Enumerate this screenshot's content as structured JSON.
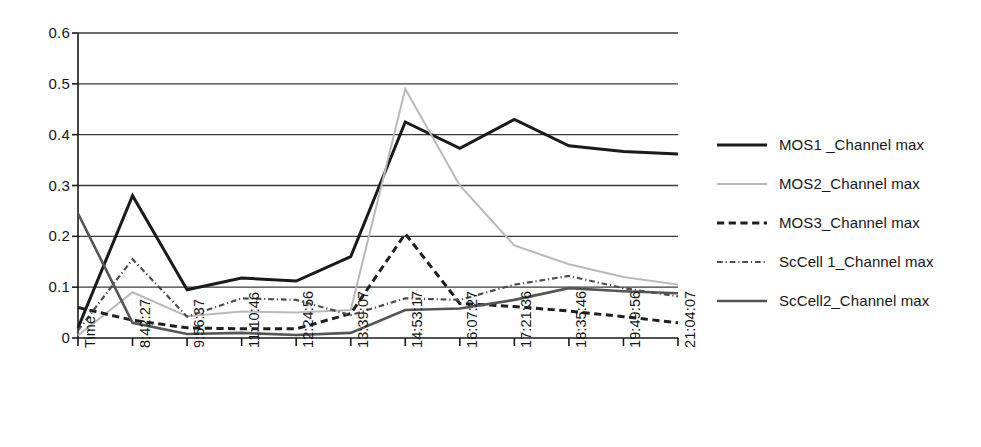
{
  "chart_data": {
    "type": "line",
    "title": "",
    "subtitle": "",
    "xlabel": "",
    "ylabel": "",
    "ylim": [
      0,
      0.6
    ],
    "ytick_labels": [
      "0.6",
      "0.5",
      "0.4",
      "0.3",
      "0.2",
      "0.1",
      "0"
    ],
    "ytick_values": [
      0.6,
      0.5,
      0.4,
      0.3,
      0.2,
      0.1,
      0
    ],
    "grid": "horizontal",
    "legend_position": "right",
    "categories": [
      "Time",
      "8:42:27",
      "9:56:37",
      "11:10:46",
      "12:24:56",
      "13:39:07",
      "14:53:17",
      "16:07:27",
      "17:21:36",
      "18:35:46",
      "19:49:56",
      "21:04:07"
    ],
    "series": [
      {
        "name": "MOS1 _Channel max",
        "color": "#1a1a1a",
        "style": "solid",
        "width": 3.0,
        "values": [
          0.02,
          0.28,
          0.095,
          0.118,
          0.112,
          0.16,
          0.425,
          0.373,
          0.43,
          0.378,
          0.367,
          0.362
        ]
      },
      {
        "name": "MOS2_Channel max",
        "color": "#b9b9b9",
        "style": "solid",
        "width": 2.0,
        "values": [
          0.005,
          0.09,
          0.043,
          0.052,
          0.05,
          0.055,
          0.49,
          0.3,
          0.182,
          0.145,
          0.12,
          0.105
        ]
      },
      {
        "name": "MOS3_Channel max",
        "color": "#1f1f1f",
        "style": "dashed",
        "width": 3.0,
        "values": [
          0.06,
          0.035,
          0.02,
          0.018,
          0.018,
          0.048,
          0.205,
          0.068,
          0.062,
          0.053,
          0.042,
          0.03
        ]
      },
      {
        "name": "ScCell 1_Channel max",
        "color": "#4d4d4d",
        "style": "dashdot",
        "width": 2.2,
        "values": [
          0.015,
          0.155,
          0.042,
          0.078,
          0.075,
          0.045,
          0.078,
          0.075,
          0.105,
          0.122,
          0.098,
          0.082
        ]
      },
      {
        "name": "ScCell2_Channel max",
        "color": "#555555",
        "style": "solid",
        "width": 2.6,
        "values": [
          0.245,
          0.03,
          0.008,
          0.01,
          0.006,
          0.01,
          0.055,
          0.058,
          0.075,
          0.098,
          0.092,
          0.088
        ]
      }
    ]
  },
  "legend": {
    "items": [
      {
        "label": "MOS1 _Channel max"
      },
      {
        "label": "MOS2_Channel max"
      },
      {
        "label": "MOS3_Channel max"
      },
      {
        "label": "ScCell 1_Channel max"
      },
      {
        "label": "ScCell2_Channel max"
      }
    ]
  },
  "axes": {
    "y_ticks": [
      "0.6",
      "0.5",
      "0.4",
      "0.3",
      "0.2",
      "0.1",
      "0"
    ],
    "x_ticks": [
      "Time",
      "8:42:27",
      "9:56:37",
      "11:10:46",
      "12:24:56",
      "13:39:07",
      "14:53:17",
      "16:07:27",
      "17:21:36",
      "18:35:46",
      "19:49:56",
      "21:04:07"
    ]
  },
  "colors": {
    "axis": "#1a1a1a",
    "grid": "#3a3a3a",
    "background": "#ffffff"
  }
}
